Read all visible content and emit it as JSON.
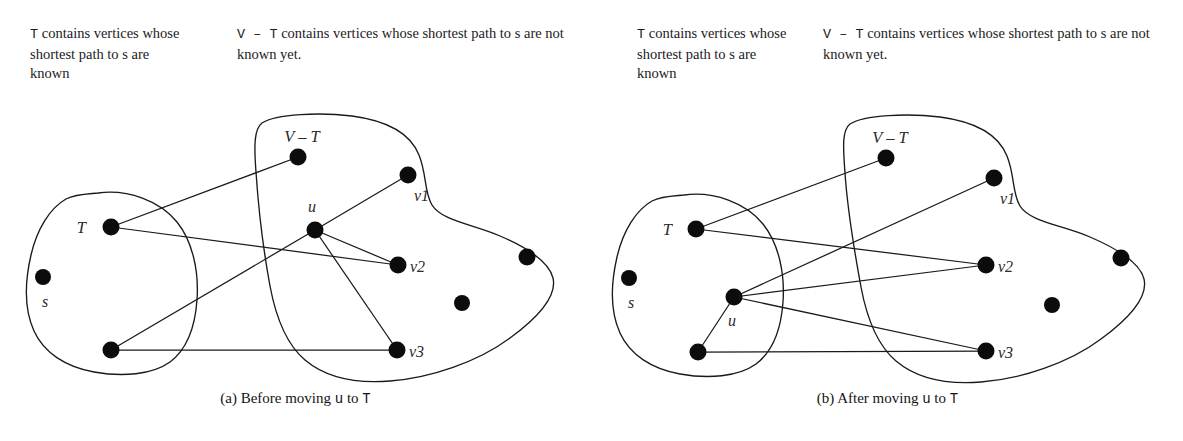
{
  "figures": [
    {
      "id": "a",
      "caption_prefix": "(a) Before moving ",
      "caption_u": "u",
      "caption_mid": " to ",
      "caption_t": "T",
      "header_left": {
        "t": "T",
        "rest": " contains vertices whose shortest path to s are known"
      },
      "header_right": {
        "vt": "V – T",
        "rest": " contains vertices whose shortest path to s are not known yet."
      },
      "labels": {
        "set_t": "T",
        "set_vt": "V – T",
        "source": "s",
        "u": "u",
        "v1": "v1",
        "v2": "v2",
        "v3": "v3"
      },
      "nodes": [
        {
          "name": "t-node",
          "x": 111,
          "y": 227,
          "r": 8.5
        },
        {
          "name": "s-node",
          "x": 43,
          "y": 277,
          "r": 8.0
        },
        {
          "name": "t-lower-node",
          "x": 111,
          "y": 350,
          "r": 8.5
        },
        {
          "name": "vt-top-node",
          "x": 298,
          "y": 157,
          "r": 8.5
        },
        {
          "name": "u-node",
          "x": 315,
          "y": 230,
          "r": 8.5
        },
        {
          "name": "v1-node",
          "x": 408,
          "y": 175,
          "r": 8.5
        },
        {
          "name": "v2-node",
          "x": 398,
          "y": 265,
          "r": 8.5
        },
        {
          "name": "v3-node",
          "x": 397,
          "y": 350,
          "r": 8.5
        },
        {
          "name": "vt-right-node",
          "x": 527,
          "y": 257,
          "r": 8.5
        },
        {
          "name": "vt-mid-node",
          "x": 462,
          "y": 303,
          "r": 8.0
        }
      ],
      "edges": [
        {
          "name": "edge-t-to-vttop",
          "from": [
            111,
            227
          ],
          "to": [
            298,
            157
          ]
        },
        {
          "name": "edge-t-to-v2",
          "from": [
            111,
            227
          ],
          "to": [
            398,
            265
          ]
        },
        {
          "name": "edge-tlower-to-u",
          "from": [
            111,
            350
          ],
          "to": [
            315,
            230
          ]
        },
        {
          "name": "edge-tlower-to-v3",
          "from": [
            111,
            350
          ],
          "to": [
            397,
            350
          ]
        },
        {
          "name": "edge-u-to-v1",
          "from": [
            315,
            230
          ],
          "to": [
            408,
            175
          ]
        },
        {
          "name": "edge-u-to-v2",
          "from": [
            315,
            230
          ],
          "to": [
            398,
            265
          ]
        },
        {
          "name": "edge-u-to-v3",
          "from": [
            315,
            230
          ],
          "to": [
            397,
            350
          ]
        }
      ],
      "u_in_region": "V-T"
    },
    {
      "id": "b",
      "caption_prefix": "(b) After moving ",
      "caption_u": "u",
      "caption_mid": " to ",
      "caption_t": "T",
      "header_left": {
        "t": "T",
        "rest": " contains vertices whose shortest path to s are known"
      },
      "header_right": {
        "vt": "V – T",
        "rest": " contains vertices whose shortest path to s are not known yet."
      },
      "labels": {
        "set_t": "T",
        "set_vt": "V – T",
        "source": "s",
        "u": "u",
        "v1": "v1",
        "v2": "v2",
        "v3": "v3"
      },
      "nodes": [
        {
          "name": "t-node",
          "x": 104,
          "y": 229,
          "r": 8.5
        },
        {
          "name": "s-node",
          "x": 37,
          "y": 278,
          "r": 8.0
        },
        {
          "name": "u-node",
          "x": 142,
          "y": 297,
          "r": 8.5
        },
        {
          "name": "t-lower-node",
          "x": 106,
          "y": 352,
          "r": 8.5
        },
        {
          "name": "vt-top-node",
          "x": 294,
          "y": 158,
          "r": 8.5
        },
        {
          "name": "v1-node",
          "x": 402,
          "y": 178,
          "r": 8.5
        },
        {
          "name": "v2-node",
          "x": 394,
          "y": 265,
          "r": 8.5
        },
        {
          "name": "v3-node",
          "x": 394,
          "y": 351,
          "r": 8.5
        },
        {
          "name": "vt-right-node",
          "x": 529,
          "y": 258,
          "r": 8.5
        },
        {
          "name": "vt-mid-node",
          "x": 460,
          "y": 305,
          "r": 8.0
        }
      ],
      "edges": [
        {
          "name": "edge-t-to-vttop",
          "from": [
            104,
            229
          ],
          "to": [
            294,
            158
          ]
        },
        {
          "name": "edge-t-to-v2",
          "from": [
            104,
            229
          ],
          "to": [
            394,
            265
          ]
        },
        {
          "name": "edge-u-to-v1",
          "from": [
            142,
            297
          ],
          "to": [
            402,
            178
          ]
        },
        {
          "name": "edge-u-to-v2",
          "from": [
            142,
            297
          ],
          "to": [
            394,
            265
          ]
        },
        {
          "name": "edge-u-to-v3",
          "from": [
            142,
            297
          ],
          "to": [
            394,
            351
          ]
        },
        {
          "name": "edge-u-to-tlower",
          "from": [
            142,
            297
          ],
          "to": [
            106,
            352
          ]
        },
        {
          "name": "edge-tlower-to-v3",
          "from": [
            106,
            352
          ],
          "to": [
            394,
            351
          ]
        }
      ],
      "u_in_region": "T"
    }
  ],
  "colors": {
    "ink": "#1a1a1a",
    "node_fill": "#0c0c0c",
    "label": "#2a2a2a",
    "background": "#ffffff"
  }
}
